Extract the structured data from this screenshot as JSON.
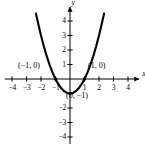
{
  "figure": {
    "width": 145,
    "height": 144,
    "background": "#ffffff",
    "ink_color": "#000000"
  },
  "chart_data": {
    "type": "line",
    "title": "",
    "subtitle": "",
    "xlabel": "x",
    "ylabel": "y",
    "xlim": [
      -4.5,
      4.5
    ],
    "ylim": [
      -4.7,
      4.7
    ],
    "grid": false,
    "legend": "none",
    "axes_style": "cartesian-crosshair-with-arrows",
    "origin_px": {
      "x": 70,
      "y": 79
    },
    "unit_px": {
      "x": 14.5,
      "y": 14.5
    },
    "x_ticks": [
      -4,
      -3,
      -2,
      -1,
      1,
      2,
      3,
      4
    ],
    "x_tick_labels": [
      "-4",
      "-3",
      "-2",
      "-1",
      "1",
      "2",
      "3",
      "4"
    ],
    "y_ticks": [
      4,
      3,
      2,
      1,
      -2,
      -3,
      -4
    ],
    "y_tick_labels": [
      "4",
      "3",
      "2",
      "1",
      "-2",
      "-3",
      "-4"
    ],
    "series": [
      {
        "name": "parabola",
        "equation": "y = x^2 - 1",
        "kind": "curve",
        "stroke": "#000000",
        "stroke_width": 2.1,
        "x_range": [
          -2.35,
          2.35
        ],
        "x": [
          -2.35,
          -2.2,
          -2.0,
          -1.8,
          -1.6,
          -1.4,
          -1.2,
          -1.0,
          -0.8,
          -0.6,
          -0.4,
          -0.2,
          0.0,
          0.2,
          0.4,
          0.6,
          0.8,
          1.0,
          1.2,
          1.4,
          1.6,
          1.8,
          2.0,
          2.2,
          2.35
        ],
        "values": [
          4.5225,
          3.84,
          3.0,
          2.24,
          1.56,
          0.96,
          0.44,
          0.0,
          -0.36,
          -0.64,
          -0.84,
          -0.96,
          -1.0,
          -0.96,
          -0.84,
          -0.64,
          -0.36,
          0.0,
          0.44,
          0.96,
          1.56,
          2.24,
          3.0,
          3.84,
          4.5225
        ]
      }
    ],
    "points": [
      {
        "name": "x-intercept-left",
        "x": -1,
        "y": 0,
        "label": "(−1, 0)"
      },
      {
        "name": "x-intercept-right",
        "x": 1,
        "y": 0,
        "label": "(1, 0)"
      },
      {
        "name": "vertex",
        "x": 0,
        "y": -1,
        "label": "(0, −1)"
      }
    ],
    "annotations": [
      {
        "name": "left-intercept-label",
        "text": "(−1, 0)",
        "x_px": 18,
        "y_px": 62
      },
      {
        "name": "right-intercept-label",
        "text": "(1, 0)",
        "x_px": 88,
        "y_px": 62
      },
      {
        "name": "vertex-label",
        "text": "(0, −1)",
        "x_px": 66,
        "y_px": 92
      }
    ]
  },
  "axis_names": {
    "x": "x",
    "y": "y"
  }
}
